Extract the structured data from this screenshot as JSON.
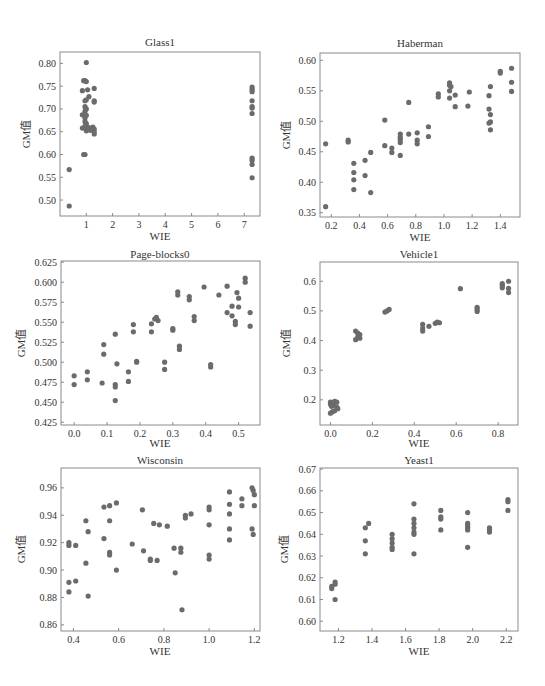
{
  "figure": {
    "marker_color": "#6b6b6b",
    "frame_color": "#8a8a8a"
  },
  "chart_data": [
    {
      "type": "scatter",
      "title": "Glass1",
      "xlabel": "WIE",
      "ylabel": "GM值",
      "frame": {
        "left": 60,
        "top": 52,
        "right": 260,
        "bottom": 216
      },
      "xlim": [
        0,
        7.6
      ],
      "ylim": [
        0.465,
        0.825
      ],
      "xticks": [
        1,
        2,
        3,
        4,
        5,
        6,
        7
      ],
      "xtick_labels": [
        "1",
        "2",
        "3",
        "4",
        "5",
        "6",
        "7"
      ],
      "yticks": [
        0.5,
        0.55,
        0.6,
        0.65,
        0.7,
        0.75,
        0.8
      ],
      "ytick_labels": [
        "0.50",
        "0.55",
        "0.60",
        "0.65",
        "0.70",
        "0.75",
        "0.80"
      ],
      "points": [
        [
          0.35,
          0.567
        ],
        [
          0.35,
          0.487
        ],
        [
          1.0,
          0.802
        ],
        [
          0.9,
          0.762
        ],
        [
          0.95,
          0.762
        ],
        [
          1.0,
          0.76
        ],
        [
          0.85,
          0.74
        ],
        [
          1.05,
          0.742
        ],
        [
          1.3,
          0.745
        ],
        [
          1.1,
          0.727
        ],
        [
          0.95,
          0.718
        ],
        [
          1.0,
          0.72
        ],
        [
          1.3,
          0.718
        ],
        [
          1.3,
          0.715
        ],
        [
          0.95,
          0.705
        ],
        [
          1.0,
          0.7
        ],
        [
          0.95,
          0.695
        ],
        [
          0.85,
          0.687
        ],
        [
          1.0,
          0.686
        ],
        [
          0.95,
          0.68
        ],
        [
          0.95,
          0.672
        ],
        [
          1.0,
          0.668
        ],
        [
          0.95,
          0.662
        ],
        [
          0.85,
          0.658
        ],
        [
          1.0,
          0.656
        ],
        [
          1.05,
          0.66
        ],
        [
          1.15,
          0.658
        ],
        [
          1.25,
          0.66
        ],
        [
          1.3,
          0.656
        ],
        [
          1.3,
          0.65
        ],
        [
          1.3,
          0.645
        ],
        [
          1.0,
          0.652
        ],
        [
          1.15,
          0.653
        ],
        [
          0.9,
          0.6
        ],
        [
          0.95,
          0.6
        ],
        [
          7.3,
          0.748
        ],
        [
          7.3,
          0.743
        ],
        [
          7.3,
          0.738
        ],
        [
          7.3,
          0.718
        ],
        [
          7.3,
          0.705
        ],
        [
          7.3,
          0.702
        ],
        [
          7.3,
          0.69
        ],
        [
          7.3,
          0.592
        ],
        [
          7.3,
          0.587
        ],
        [
          7.3,
          0.578
        ],
        [
          7.3,
          0.549
        ]
      ]
    },
    {
      "type": "scatter",
      "title": "Haberman",
      "xlabel": "WIE",
      "ylabel": "GM值",
      "frame": {
        "left": 320,
        "top": 53,
        "right": 520,
        "bottom": 217
      },
      "xlim": [
        0.12,
        1.54
      ],
      "ylim": [
        0.343,
        0.612
      ],
      "xticks": [
        0.2,
        0.4,
        0.6,
        0.8,
        1.0,
        1.2,
        1.4
      ],
      "xtick_labels": [
        "0.2",
        "0.4",
        "0.6",
        "0.8",
        "1.0",
        "1.2",
        "1.4"
      ],
      "yticks": [
        0.35,
        0.4,
        0.45,
        0.5,
        0.55,
        0.6
      ],
      "ytick_labels": [
        "0.35",
        "0.40",
        "0.45",
        "0.50",
        "0.55",
        "0.60"
      ],
      "points": [
        [
          0.16,
          0.463
        ],
        [
          0.16,
          0.36
        ],
        [
          0.32,
          0.469
        ],
        [
          0.32,
          0.466
        ],
        [
          0.36,
          0.431
        ],
        [
          0.36,
          0.416
        ],
        [
          0.36,
          0.404
        ],
        [
          0.36,
          0.388
        ],
        [
          0.44,
          0.436
        ],
        [
          0.44,
          0.411
        ],
        [
          0.48,
          0.449
        ],
        [
          0.48,
          0.383
        ],
        [
          0.58,
          0.502
        ],
        [
          0.58,
          0.46
        ],
        [
          0.63,
          0.456
        ],
        [
          0.63,
          0.449
        ],
        [
          0.69,
          0.479
        ],
        [
          0.69,
          0.474
        ],
        [
          0.69,
          0.47
        ],
        [
          0.69,
          0.465
        ],
        [
          0.69,
          0.444
        ],
        [
          0.75,
          0.531
        ],
        [
          0.75,
          0.479
        ],
        [
          0.81,
          0.481
        ],
        [
          0.81,
          0.469
        ],
        [
          0.81,
          0.463
        ],
        [
          0.89,
          0.491
        ],
        [
          0.89,
          0.475
        ],
        [
          0.96,
          0.545
        ],
        [
          0.96,
          0.54
        ],
        [
          1.04,
          0.563
        ],
        [
          1.04,
          0.559
        ],
        [
          1.05,
          0.557
        ],
        [
          1.04,
          0.55
        ],
        [
          1.04,
          0.538
        ],
        [
          1.08,
          0.543
        ],
        [
          1.08,
          0.524
        ],
        [
          1.18,
          0.548
        ],
        [
          1.17,
          0.525
        ],
        [
          1.32,
          0.542
        ],
        [
          1.33,
          0.557
        ],
        [
          1.32,
          0.52
        ],
        [
          1.33,
          0.511
        ],
        [
          1.33,
          0.499
        ],
        [
          1.32,
          0.497
        ],
        [
          1.33,
          0.486
        ],
        [
          1.4,
          0.582
        ],
        [
          1.4,
          0.579
        ],
        [
          1.48,
          0.587
        ],
        [
          1.48,
          0.564
        ],
        [
          1.48,
          0.549
        ]
      ]
    },
    {
      "type": "scatter",
      "title": "Page-blocks0",
      "xlabel": "WIE",
      "ylabel": "GM值",
      "frame": {
        "left": 61,
        "top": 261,
        "right": 260,
        "bottom": 425
      },
      "xlim": [
        -0.04,
        0.565
      ],
      "ylim": [
        0.4215,
        0.6265
      ],
      "xticks": [
        0.0,
        0.1,
        0.2,
        0.3,
        0.4,
        0.5
      ],
      "xtick_labels": [
        "0.0",
        "0.1",
        "0.2",
        "0.3",
        "0.4",
        "0.5"
      ],
      "yticks": [
        0.425,
        0.45,
        0.475,
        0.5,
        0.525,
        0.55,
        0.575,
        0.6,
        0.625
      ],
      "ytick_labels": [
        "0.425",
        "0.450",
        "0.475",
        "0.500",
        "0.525",
        "0.550",
        "0.575",
        "0.600",
        "0.625"
      ],
      "points": [
        [
          0.0,
          0.483
        ],
        [
          0.0,
          0.472
        ],
        [
          0.04,
          0.488
        ],
        [
          0.04,
          0.478
        ],
        [
          0.085,
          0.474
        ],
        [
          0.09,
          0.522
        ],
        [
          0.09,
          0.51
        ],
        [
          0.125,
          0.535
        ],
        [
          0.125,
          0.472
        ],
        [
          0.125,
          0.469
        ],
        [
          0.125,
          0.452
        ],
        [
          0.13,
          0.498
        ],
        [
          0.165,
          0.488
        ],
        [
          0.165,
          0.476
        ],
        [
          0.18,
          0.547
        ],
        [
          0.18,
          0.538
        ],
        [
          0.19,
          0.501
        ],
        [
          0.19,
          0.5
        ],
        [
          0.235,
          0.548
        ],
        [
          0.235,
          0.538
        ],
        [
          0.245,
          0.554
        ],
        [
          0.25,
          0.556
        ],
        [
          0.255,
          0.552
        ],
        [
          0.275,
          0.5
        ],
        [
          0.275,
          0.491
        ],
        [
          0.3,
          0.542
        ],
        [
          0.3,
          0.54
        ],
        [
          0.315,
          0.588
        ],
        [
          0.315,
          0.584
        ],
        [
          0.32,
          0.52
        ],
        [
          0.32,
          0.516
        ],
        [
          0.35,
          0.582
        ],
        [
          0.35,
          0.578
        ],
        [
          0.365,
          0.557
        ],
        [
          0.365,
          0.552
        ],
        [
          0.395,
          0.594
        ],
        [
          0.415,
          0.497
        ],
        [
          0.415,
          0.494
        ],
        [
          0.44,
          0.584
        ],
        [
          0.465,
          0.595
        ],
        [
          0.465,
          0.562
        ],
        [
          0.48,
          0.57
        ],
        [
          0.48,
          0.558
        ],
        [
          0.49,
          0.551
        ],
        [
          0.49,
          0.547
        ],
        [
          0.495,
          0.587
        ],
        [
          0.5,
          0.58
        ],
        [
          0.5,
          0.569
        ],
        [
          0.52,
          0.605
        ],
        [
          0.52,
          0.6
        ],
        [
          0.535,
          0.562
        ],
        [
          0.535,
          0.545
        ]
      ]
    },
    {
      "type": "scatter",
      "title": "Vehicle1",
      "xlabel": "WIE",
      "ylabel": "GM值",
      "frame": {
        "left": 320,
        "top": 262,
        "right": 518,
        "bottom": 425
      },
      "xlim": [
        -0.05,
        0.895
      ],
      "ylim": [
        0.115,
        0.665
      ],
      "xticks": [
        0.0,
        0.2,
        0.4,
        0.6,
        0.8
      ],
      "xtick_labels": [
        "0.0",
        "0.2",
        "0.4",
        "0.6",
        "0.8"
      ],
      "yticks": [
        0.2,
        0.3,
        0.4,
        0.5,
        0.6
      ],
      "ytick_labels": [
        "0.2",
        "0.3",
        "0.4",
        "0.5",
        "0.6"
      ],
      "points": [
        [
          0.0,
          0.192
        ],
        [
          0.0,
          0.185
        ],
        [
          0.005,
          0.178
        ],
        [
          0.01,
          0.19
        ],
        [
          0.015,
          0.182
        ],
        [
          0.02,
          0.195
        ],
        [
          0.03,
          0.192
        ],
        [
          0.0,
          0.155
        ],
        [
          0.01,
          0.16
        ],
        [
          0.02,
          0.163
        ],
        [
          0.03,
          0.175
        ],
        [
          0.035,
          0.17
        ],
        [
          0.12,
          0.432
        ],
        [
          0.12,
          0.403
        ],
        [
          0.13,
          0.425
        ],
        [
          0.13,
          0.412
        ],
        [
          0.14,
          0.42
        ],
        [
          0.14,
          0.408
        ],
        [
          0.26,
          0.496
        ],
        [
          0.27,
          0.5
        ],
        [
          0.28,
          0.505
        ],
        [
          0.44,
          0.455
        ],
        [
          0.44,
          0.442
        ],
        [
          0.44,
          0.432
        ],
        [
          0.47,
          0.448
        ],
        [
          0.5,
          0.458
        ],
        [
          0.51,
          0.462
        ],
        [
          0.52,
          0.46
        ],
        [
          0.62,
          0.575
        ],
        [
          0.7,
          0.512
        ],
        [
          0.7,
          0.505
        ],
        [
          0.7,
          0.498
        ],
        [
          0.82,
          0.592
        ],
        [
          0.82,
          0.585
        ],
        [
          0.82,
          0.578
        ],
        [
          0.85,
          0.6
        ],
        [
          0.85,
          0.576
        ],
        [
          0.85,
          0.562
        ]
      ]
    },
    {
      "type": "scatter",
      "title": "Wisconsin",
      "xlabel": "WIE",
      "ylabel": "GM值",
      "frame": {
        "left": 61,
        "top": 468,
        "right": 260,
        "bottom": 631
      },
      "xlim": [
        0.345,
        1.225
      ],
      "ylim": [
        0.8555,
        0.9745
      ],
      "xticks": [
        0.4,
        0.6,
        0.8,
        1.0,
        1.2
      ],
      "xtick_labels": [
        "0.4",
        "0.6",
        "0.8",
        "1.0",
        "1.2"
      ],
      "yticks": [
        0.86,
        0.88,
        0.9,
        0.92,
        0.94,
        0.96
      ],
      "ytick_labels": [
        "0.86",
        "0.88",
        "0.90",
        "0.92",
        "0.94",
        "0.96"
      ],
      "points": [
        [
          0.38,
          0.92
        ],
        [
          0.38,
          0.918
        ],
        [
          0.38,
          0.891
        ],
        [
          0.38,
          0.884
        ],
        [
          0.41,
          0.918
        ],
        [
          0.41,
          0.892
        ],
        [
          0.455,
          0.936
        ],
        [
          0.455,
          0.905
        ],
        [
          0.465,
          0.928
        ],
        [
          0.465,
          0.881
        ],
        [
          0.535,
          0.946
        ],
        [
          0.535,
          0.923
        ],
        [
          0.56,
          0.947
        ],
        [
          0.56,
          0.936
        ],
        [
          0.56,
          0.913
        ],
        [
          0.56,
          0.911
        ],
        [
          0.59,
          0.949
        ],
        [
          0.59,
          0.9
        ],
        [
          0.66,
          0.919
        ],
        [
          0.705,
          0.944
        ],
        [
          0.71,
          0.914
        ],
        [
          0.74,
          0.908
        ],
        [
          0.74,
          0.907
        ],
        [
          0.755,
          0.934
        ],
        [
          0.77,
          0.907
        ],
        [
          0.78,
          0.933
        ],
        [
          0.815,
          0.932
        ],
        [
          0.845,
          0.916
        ],
        [
          0.85,
          0.898
        ],
        [
          0.875,
          0.916
        ],
        [
          0.875,
          0.913
        ],
        [
          0.88,
          0.871
        ],
        [
          0.895,
          0.94
        ],
        [
          0.895,
          0.938
        ],
        [
          0.92,
          0.941
        ],
        [
          1.0,
          0.946
        ],
        [
          1.0,
          0.944
        ],
        [
          1.0,
          0.933
        ],
        [
          1.0,
          0.911
        ],
        [
          1.0,
          0.908
        ],
        [
          1.09,
          0.957
        ],
        [
          1.09,
          0.948
        ],
        [
          1.09,
          0.941
        ],
        [
          1.09,
          0.93
        ],
        [
          1.09,
          0.922
        ],
        [
          1.145,
          0.952
        ],
        [
          1.145,
          0.947
        ],
        [
          1.19,
          0.96
        ],
        [
          1.195,
          0.958
        ],
        [
          1.2,
          0.955
        ],
        [
          1.2,
          0.947
        ],
        [
          1.19,
          0.93
        ],
        [
          1.195,
          0.926
        ]
      ]
    },
    {
      "type": "scatter",
      "title": "Yeast1",
      "xlabel": "WIE",
      "ylabel": "GM值",
      "frame": {
        "left": 320,
        "top": 468,
        "right": 518,
        "bottom": 631
      },
      "xlim": [
        1.09,
        2.27
      ],
      "ylim": [
        0.5955,
        0.6705
      ],
      "xticks": [
        1.2,
        1.4,
        1.6,
        1.8,
        2.0,
        2.2
      ],
      "xtick_labels": [
        "1.2",
        "1.4",
        "1.6",
        "1.8",
        "2.0",
        "2.2"
      ],
      "yticks": [
        0.6,
        0.61,
        0.62,
        0.63,
        0.64,
        0.65,
        0.66,
        0.67
      ],
      "ytick_labels": [
        "0.60",
        "0.61",
        "0.62",
        "0.63",
        "0.64",
        "0.65",
        "0.66",
        "0.67"
      ],
      "points": [
        [
          1.16,
          0.616
        ],
        [
          1.16,
          0.615
        ],
        [
          1.18,
          0.618
        ],
        [
          1.18,
          0.617
        ],
        [
          1.18,
          0.61
        ],
        [
          1.36,
          0.643
        ],
        [
          1.36,
          0.637
        ],
        [
          1.36,
          0.631
        ],
        [
          1.38,
          0.645
        ],
        [
          1.52,
          0.64
        ],
        [
          1.52,
          0.638
        ],
        [
          1.52,
          0.636
        ],
        [
          1.52,
          0.634
        ],
        [
          1.52,
          0.633
        ],
        [
          1.65,
          0.654
        ],
        [
          1.65,
          0.647
        ],
        [
          1.65,
          0.645
        ],
        [
          1.65,
          0.643
        ],
        [
          1.65,
          0.641
        ],
        [
          1.65,
          0.64
        ],
        [
          1.65,
          0.631
        ],
        [
          1.81,
          0.651
        ],
        [
          1.81,
          0.648
        ],
        [
          1.81,
          0.647
        ],
        [
          1.81,
          0.642
        ],
        [
          1.97,
          0.65
        ],
        [
          1.97,
          0.645
        ],
        [
          1.97,
          0.644
        ],
        [
          1.97,
          0.643
        ],
        [
          1.97,
          0.642
        ],
        [
          1.97,
          0.634
        ],
        [
          2.1,
          0.643
        ],
        [
          2.1,
          0.642
        ],
        [
          2.1,
          0.641
        ],
        [
          2.21,
          0.656
        ],
        [
          2.21,
          0.655
        ],
        [
          2.21,
          0.651
        ]
      ]
    }
  ]
}
